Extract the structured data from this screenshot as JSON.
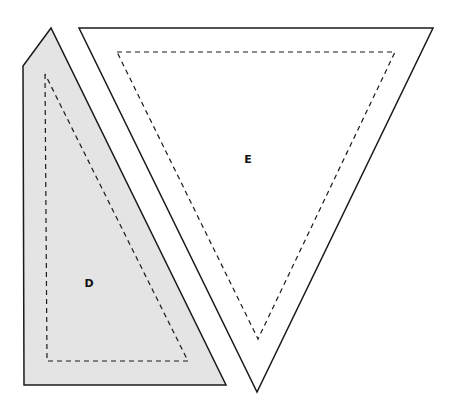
{
  "diagram": {
    "type": "pattern-pieces",
    "pieces": [
      {
        "id": "D",
        "label": "D",
        "fill": "#e4e4e4",
        "stroke": "#1a1a1a",
        "outline": "51,28 23,66 24,385 226,385",
        "seam": "45,74 47,361 188,361",
        "label_pos": [
          89,
          287
        ]
      },
      {
        "id": "E",
        "label": "E",
        "fill": "#ffffff",
        "stroke": "#1a1a1a",
        "outline": "79,28 433,28 257,392",
        "seam": "117,52 395,52 258,339",
        "label_pos": [
          248,
          163
        ]
      }
    ]
  }
}
